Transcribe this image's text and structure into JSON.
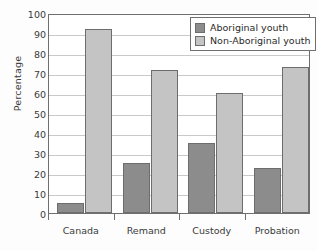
{
  "chart_data": {
    "type": "bar",
    "title": "",
    "subtitle": "",
    "xlabel": "",
    "ylabel": "Percentage",
    "ylim": [
      0,
      100
    ],
    "ytick_step": 10,
    "yticks": [
      0,
      10,
      20,
      30,
      40,
      50,
      60,
      70,
      80,
      90,
      100
    ],
    "ytick_labels": [
      "0",
      "10",
      "20",
      "30",
      "40",
      "50",
      "60",
      "70",
      "80",
      "90",
      "100"
    ],
    "categories": [
      "Canada",
      "Remand",
      "Custody",
      "Probation"
    ],
    "series": [
      {
        "name": "Aboriginal youth",
        "color": "#8c8c8c",
        "values": [
          5,
          25,
          35,
          22.5
        ]
      },
      {
        "name": "Non-Aboriginal youth",
        "color": "#c4c4c4",
        "values": [
          92,
          71.5,
          60,
          73
        ]
      }
    ],
    "grid": {
      "horizontal": true,
      "vertical": false,
      "color": "#c9c9c9"
    },
    "legend": {
      "position": "top-right",
      "inside_plot": true,
      "entries": [
        {
          "label": "Aboriginal youth",
          "color": "#8c8c8c"
        },
        {
          "label": "Non-Aboriginal youth",
          "color": "#c4c4c4"
        }
      ]
    },
    "axis_color": "#6f6f6f",
    "plot_background": "#ffffff"
  }
}
